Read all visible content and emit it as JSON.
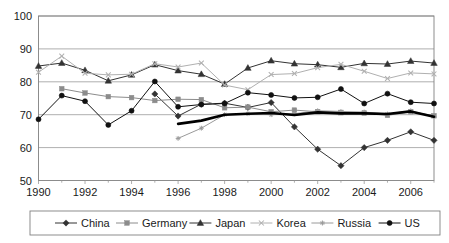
{
  "chart_data": {
    "type": "line",
    "title": "",
    "xlabel": "",
    "ylabel": "",
    "xlim": [
      1990,
      2007
    ],
    "ylim": [
      50,
      100
    ],
    "grid": true,
    "legend_position": "bottom",
    "y_ticks": [
      50,
      60,
      70,
      80,
      90,
      100
    ],
    "x_ticks": [
      1990,
      1992,
      1994,
      1996,
      1998,
      2000,
      2002,
      2004,
      2006
    ],
    "x": [
      1990,
      1991,
      1992,
      1993,
      1994,
      1995,
      1996,
      1997,
      1998,
      1999,
      2000,
      2001,
      2002,
      2003,
      2004,
      2005,
      2006,
      2007
    ],
    "series": [
      {
        "name": "China",
        "marker": "diamond",
        "color": "#333333",
        "line_width": 1,
        "x": [
          1995,
          1996,
          1997,
          1998,
          1999,
          2000,
          2001,
          2002,
          2003,
          2004,
          2005,
          2006,
          2007
        ],
        "values": [
          76.3,
          69.6,
          73.2,
          73.5,
          72.2,
          73.7,
          66.3,
          59.5,
          54.5,
          60.0,
          62.2,
          64.8,
          62.2
        ]
      },
      {
        "name": "Germany",
        "marker": "square",
        "color": "#8c8c8c",
        "line_width": 1,
        "x": [
          1991,
          1992,
          1993,
          1994,
          1995,
          1996,
          1997,
          1998,
          1999,
          2000,
          2001,
          2002,
          2003,
          2004,
          2005,
          2006,
          2007
        ],
        "values": [
          77.9,
          76.6,
          75.5,
          75.2,
          74.3,
          74.7,
          74.6,
          72.1,
          72.3,
          70.9,
          71.4,
          70.9,
          70.6,
          70.5,
          69.8,
          70.9,
          69.7
        ]
      },
      {
        "name": "Japan",
        "marker": "triangle",
        "color": "#333333",
        "line_width": 1,
        "x": [
          1990,
          1991,
          1992,
          1993,
          1994,
          1995,
          1996,
          1997,
          1998,
          1999,
          2000,
          2001,
          2002,
          2003,
          2004,
          2005,
          2006,
          2007
        ],
        "values": [
          84.8,
          85.7,
          83.5,
          80.3,
          82.1,
          85.2,
          83.4,
          82.3,
          79.3,
          84.2,
          86.4,
          85.5,
          85.2,
          84.4,
          85.6,
          85.4,
          86.3,
          85.7
        ]
      },
      {
        "name": "Korea",
        "marker": "x",
        "color": "#b0b0b0",
        "line_width": 1,
        "x": [
          1990,
          1991,
          1992,
          1993,
          1994,
          1995,
          1996,
          1997,
          1998,
          1999,
          2000,
          2001,
          2002,
          2003,
          2004,
          2005,
          2006,
          2007
        ],
        "values": [
          82.9,
          87.8,
          82.6,
          82.1,
          82.3,
          85.5,
          84.5,
          85.7,
          79.0,
          77.6,
          82.2,
          82.5,
          84.3,
          85.3,
          83.2,
          81.0,
          82.7,
          82.4
        ]
      },
      {
        "name": "Russia",
        "marker": "star",
        "color": "#9a9a9a",
        "line_width": 1,
        "x": [
          1996,
          1997,
          1998,
          1999,
          2000,
          2001,
          2002,
          2003,
          2004,
          2005,
          2006,
          2007
        ],
        "values": [
          62.8,
          65.9,
          70.0,
          70.3,
          70.0,
          70.3,
          71.2,
          71.0,
          70.8,
          70.2,
          71.2,
          69.4
        ]
      },
      {
        "name": "US",
        "marker": "circle",
        "color": "#111111",
        "line_width": 1,
        "x": [
          1990,
          1991,
          1992,
          1993,
          1994,
          1995,
          1996,
          1997,
          1998,
          1999,
          2000,
          2001,
          2002,
          2003,
          2004,
          2005,
          2006,
          2007
        ],
        "values": [
          68.6,
          75.8,
          74.1,
          66.9,
          71.2,
          80.1,
          72.4,
          73.1,
          73.4,
          76.7,
          76.0,
          75.1,
          75.3,
          77.8,
          73.4,
          76.4,
          73.8,
          73.4
        ]
      }
    ],
    "overlay_series": {
      "name": "thick-black-trend",
      "marker": "none",
      "color": "#000000",
      "line_width": 2.6,
      "x": [
        1996,
        1997,
        1998,
        1999,
        2000,
        2001,
        2002,
        2003,
        2004,
        2005,
        2006,
        2007
      ],
      "values": [
        67.2,
        68.2,
        70.0,
        70.3,
        70.5,
        69.9,
        70.7,
        70.4,
        70.4,
        70.2,
        71.0,
        69.4
      ]
    }
  },
  "axis": {
    "y_tick_labels": [
      "100",
      "90",
      "80",
      "70",
      "60",
      "50"
    ],
    "x_tick_labels": [
      "1990",
      "1992",
      "1994",
      "1996",
      "1998",
      "2000",
      "2002",
      "2004",
      "2006"
    ]
  },
  "legend": {
    "items": [
      {
        "label": "China",
        "marker": "diamond",
        "color": "#333333"
      },
      {
        "label": "Germany",
        "marker": "square",
        "color": "#8c8c8c"
      },
      {
        "label": "Japan",
        "marker": "triangle",
        "color": "#333333"
      },
      {
        "label": "Korea",
        "marker": "x",
        "color": "#b0b0b0"
      },
      {
        "label": "Russia",
        "marker": "star",
        "color": "#9a9a9a"
      },
      {
        "label": "US",
        "marker": "circle",
        "color": "#111111"
      }
    ]
  }
}
